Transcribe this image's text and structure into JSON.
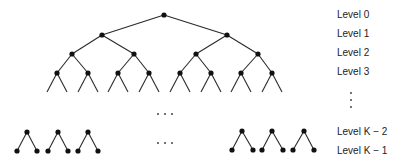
{
  "diagram": {
    "type": "binary-tree",
    "colors": {
      "edge": "#2a2a2a",
      "node": "#111111",
      "text": "#222222"
    },
    "levels": [
      {
        "id": "level-0",
        "label": "Level 0",
        "y": 15
      },
      {
        "id": "level-1",
        "label": "Level 1",
        "y": 34
      },
      {
        "id": "level-2",
        "label": "Level 2",
        "y": 53
      },
      {
        "id": "level-3",
        "label": "Level 3",
        "y": 72
      },
      {
        "id": "level-k-2",
        "label": "Level K − 2",
        "y": 132
      },
      {
        "id": "level-k-1",
        "label": "Level K − 1",
        "y": 151
      }
    ],
    "vertical_ellipsis": "⋮",
    "horizontal_ellipsis": "· · ·",
    "nodes": {
      "level0": [
        [
          164,
          15
        ]
      ],
      "level1": [
        [
          102,
          35
        ],
        [
          227,
          35
        ]
      ],
      "level2": [
        [
          72,
          54
        ],
        [
          134,
          54
        ],
        [
          196,
          54
        ],
        [
          258,
          54
        ]
      ],
      "level3": [
        [
          57,
          73
        ],
        [
          88,
          73
        ],
        [
          118,
          73
        ],
        [
          149,
          73
        ],
        [
          180,
          73
        ],
        [
          211,
          73
        ],
        [
          241,
          73
        ],
        [
          272,
          73
        ]
      ],
      "levelK2_left": [
        [
          27,
          132
        ],
        [
          58,
          132
        ],
        [
          88,
          132
        ]
      ],
      "levelK1_left": [
        [
          17,
          151
        ],
        [
          37,
          151
        ],
        [
          48,
          151
        ],
        [
          68,
          151
        ],
        [
          78,
          151
        ],
        [
          98,
          151
        ]
      ],
      "levelK2_right": [
        [
          242,
          131
        ],
        [
          272,
          131
        ],
        [
          304,
          131
        ]
      ],
      "levelK1_right": [
        [
          232,
          150
        ],
        [
          253,
          150
        ],
        [
          262,
          150
        ],
        [
          283,
          150
        ],
        [
          293,
          150
        ],
        [
          314,
          150
        ]
      ]
    }
  }
}
